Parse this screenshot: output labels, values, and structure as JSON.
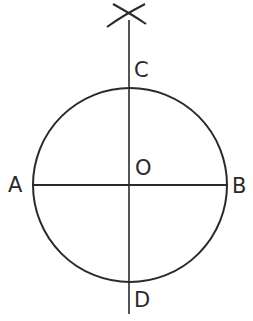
{
  "diagram": {
    "type": "geometric-construction",
    "stroke_color": "#2a2a2a",
    "circle": {
      "cx": 130,
      "cy": 185,
      "r": 97
    },
    "labels": {
      "A": "A",
      "B": "B",
      "C": "C",
      "D": "D",
      "O": "O"
    }
  }
}
